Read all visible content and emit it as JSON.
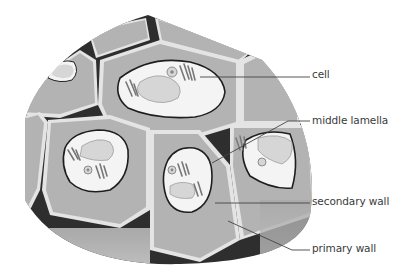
{
  "diagram": {
    "type": "plant cell tissue cross-section",
    "labels": [
      {
        "id": "cell",
        "text": "cell"
      },
      {
        "id": "middle_lamella",
        "text": "middle lamella"
      },
      {
        "id": "secondary_wall",
        "text": "secondary wall"
      },
      {
        "id": "primary_wall",
        "text": "primary wall"
      }
    ],
    "colors": {
      "background": "#ffffff",
      "secondary_wall": "#b3b3b3",
      "primary_wall": "#e4e4e4",
      "middle_lamella": "#2e2e2e",
      "cytoplasm": "#f4f4f4",
      "vacuole": "#d6d6d6",
      "organelle": "#8a8a8a",
      "label_text": "#3a3a3a",
      "leader_line": "#444444"
    }
  }
}
